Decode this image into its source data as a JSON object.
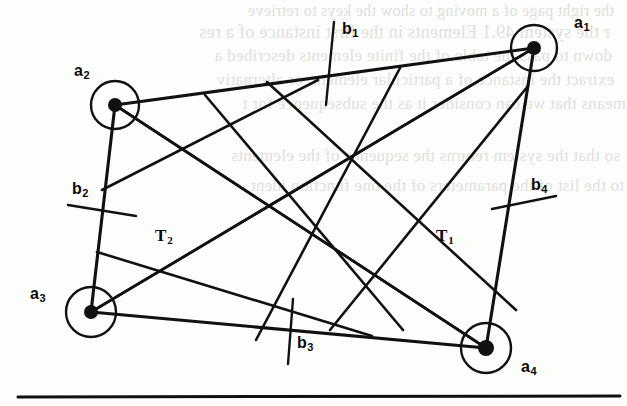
{
  "page": {
    "width": 627,
    "height": 406,
    "background_color": "#fdfdfc",
    "ink_color": "#111111",
    "bleed_color": "#c9c9c6"
  },
  "figure": {
    "kind": "graph-diagram",
    "nodes": [
      {
        "id": "a1",
        "label": "a",
        "subscript": "1",
        "cx": 534,
        "cy": 48,
        "r": 23,
        "dot_r": 7,
        "label_x": 574,
        "label_y": 14
      },
      {
        "id": "a2",
        "label": "a",
        "subscript": "2",
        "cx": 115,
        "cy": 105,
        "r": 24,
        "dot_r": 7,
        "label_x": 74,
        "label_y": 62
      },
      {
        "id": "a3",
        "label": "a",
        "subscript": "3",
        "cx": 91,
        "cy": 312,
        "r": 25,
        "dot_r": 7,
        "label_x": 30,
        "label_y": 285
      },
      {
        "id": "a4",
        "label": "a",
        "subscript": "4",
        "cx": 486,
        "cy": 348,
        "r": 25,
        "dot_r": 8,
        "label_x": 521,
        "label_y": 358
      }
    ],
    "edges": [
      {
        "id": "edge-a2-a1",
        "from": "a2",
        "to": "a1",
        "role": "outer-top"
      },
      {
        "id": "edge-a2-a3",
        "from": "a2",
        "to": "a3",
        "role": "outer-left"
      },
      {
        "id": "edge-a3-a4",
        "from": "a3",
        "to": "a4",
        "role": "outer-bottom"
      },
      {
        "id": "edge-a1-a4",
        "from": "a1",
        "to": "a4",
        "role": "outer-right"
      },
      {
        "id": "diagonal-a3-a1",
        "from": "a3",
        "to": "a1",
        "role": "diagonal-T1"
      },
      {
        "id": "diagonal-a2-a4",
        "from": "a2",
        "to": "a4",
        "role": "diagonal-T2"
      }
    ],
    "tick_marks": [
      {
        "id": "b1",
        "label": "b",
        "subscript": "1",
        "x1": 334,
        "y1": 22,
        "x2": 326,
        "y2": 105,
        "label_x": 342,
        "label_y": 20
      },
      {
        "id": "b2",
        "label": "b",
        "subscript": "2",
        "x1": 68,
        "y1": 205,
        "x2": 136,
        "y2": 216,
        "label_x": 72,
        "label_y": 180
      },
      {
        "id": "b3",
        "label": "b",
        "subscript": "3",
        "x1": 293,
        "y1": 299,
        "x2": 288,
        "y2": 364,
        "label_x": 297,
        "label_y": 334
      },
      {
        "id": "b4",
        "label": "b",
        "subscript": "4",
        "x1": 492,
        "y1": 209,
        "x2": 556,
        "y2": 196,
        "label_x": 531,
        "label_y": 176
      }
    ],
    "region_labels": [
      {
        "id": "T1",
        "label": "T",
        "subscript": "1",
        "x": 436,
        "y": 226
      },
      {
        "id": "T2",
        "label": "T",
        "subscript": "2",
        "x": 155,
        "y": 226
      }
    ],
    "lattice_lines": [
      {
        "id": "zig-1",
        "x1": 115,
        "y1": 105,
        "x2": 486,
        "y2": 348
      },
      {
        "id": "zig-2",
        "x1": 91,
        "y1": 312,
        "x2": 534,
        "y2": 48
      },
      {
        "id": "zig-3",
        "x1": 205,
        "y1": 95,
        "x2": 403,
        "y2": 330
      },
      {
        "id": "zig-4",
        "x1": 102,
        "y1": 190,
        "x2": 318,
        "y2": 80
      },
      {
        "id": "zig-5",
        "x1": 97,
        "y1": 252,
        "x2": 372,
        "y2": 336
      },
      {
        "id": "zig-6",
        "x1": 267,
        "y1": 82,
        "x2": 516,
        "y2": 310
      },
      {
        "id": "zig-7",
        "x1": 330,
        "y1": 330,
        "x2": 528,
        "y2": 86
      },
      {
        "id": "zig-8",
        "x1": 400,
        "y1": 68,
        "x2": 256,
        "y2": 340
      }
    ],
    "rule": {
      "id": "bottom-rule",
      "x1": 18,
      "y1": 397,
      "x2": 620,
      "y2": 396,
      "thickness": 3
    }
  },
  "bleed_text": {
    "note": "faint mirrored show-through text from reverse of the printed page",
    "lines": [
      {
        "text": "the right page of a moving to show the keys to retrieve",
        "x": 14,
        "y": 2,
        "size": 16
      },
      {
        "text": "r the system 49.1 Elements  in the first instance of a res",
        "x": 10,
        "y": 22,
        "size": 18
      },
      {
        "text": "down to pass the table of the finite elements described a",
        "x": 12,
        "y": 46,
        "size": 17
      },
      {
        "text": "extract the instance of a particular element, or alternativ",
        "x": 14,
        "y": 70,
        "size": 17
      },
      {
        "text": "means that we can consider it as the subsequence for t",
        "x": 26,
        "y": 94,
        "size": 17
      },
      {
        "text": "so that the system returns the sequence of the elements",
        "x": 20,
        "y": 146,
        "size": 17
      },
      {
        "text": "to the list of the parameters of the one function ident",
        "x": 24,
        "y": 176,
        "size": 17
      }
    ]
  }
}
